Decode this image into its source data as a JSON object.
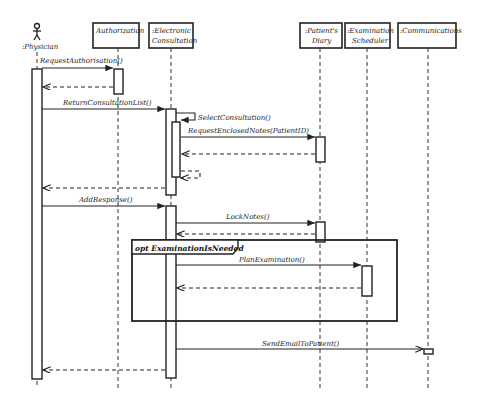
{
  "diagram": {
    "type": "sequence",
    "participants": [
      {
        "id": "physician",
        "label": ":Physician",
        "kind": "actor"
      },
      {
        "id": "authorization",
        "label": "Authorization",
        "kind": "object"
      },
      {
        "id": "consultation",
        "label_line1": ":Electronic",
        "label_line2": "Consultation",
        "kind": "object"
      },
      {
        "id": "diary",
        "label_line1": ":Patient's",
        "label_line2": "Diary",
        "kind": "object"
      },
      {
        "id": "scheduler",
        "label_line1": ":Examination",
        "label_line2": "Scheduler",
        "kind": "object"
      },
      {
        "id": "communications",
        "label": ":Communications",
        "kind": "object"
      }
    ],
    "messages": [
      {
        "label": "RequestAuthorisation()",
        "from": "physician",
        "to": "authorization"
      },
      {
        "label": "",
        "from": "authorization",
        "to": "physician",
        "return": true
      },
      {
        "label": "ReturnConsultationList()",
        "from": "physician",
        "to": "consultation"
      },
      {
        "label": "SelectConsultation()",
        "from": "consultation",
        "to": "consultation"
      },
      {
        "label": "RequestEnclosedNotes(PatientID)",
        "from": "consultation",
        "to": "diary"
      },
      {
        "label": "",
        "from": "diary",
        "to": "consultation",
        "return": true
      },
      {
        "label": "",
        "from": "consultation",
        "to": "consultation",
        "return": true
      },
      {
        "label": "",
        "from": "consultation",
        "to": "physician",
        "return": true
      },
      {
        "label": "AddResponse()",
        "from": "physician",
        "to": "consultation"
      },
      {
        "label": "LockNotes()",
        "from": "consultation",
        "to": "diary"
      },
      {
        "label": "",
        "from": "diary",
        "to": "consultation",
        "return": true
      },
      {
        "label": "PlanExamination()",
        "from": "consultation",
        "to": "scheduler"
      },
      {
        "label": "",
        "from": "scheduler",
        "to": "consultation",
        "return": true
      },
      {
        "label": "SendEmailToPatient()",
        "from": "consultation",
        "to": "communications"
      },
      {
        "label": "",
        "from": "consultation",
        "to": "physician",
        "return": true
      }
    ],
    "fragments": [
      {
        "operator": "opt",
        "guard": "ExaminationIsNeeded",
        "label": "opt ExaminationIsNeeded"
      }
    ]
  }
}
